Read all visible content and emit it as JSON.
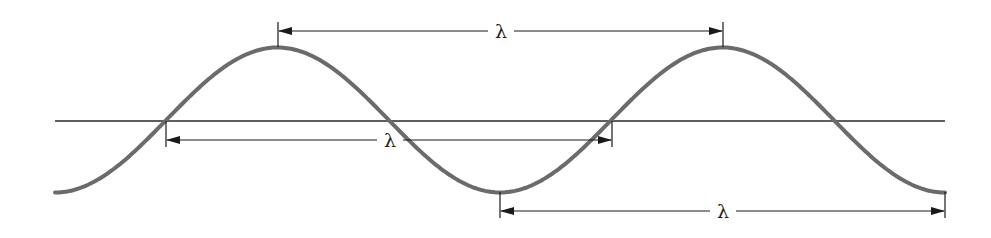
{
  "diagram": {
    "title": "",
    "colors": {
      "wave": "#6b6b6b",
      "axis": "#2a2a2a",
      "dimension_lines": "#1a1a1a",
      "background": "#ffffff"
    },
    "labels": {
      "top": "λ",
      "middle": "λ",
      "bottom": "λ"
    },
    "measurements": [
      {
        "name": "crest-to-crest",
        "label": "λ",
        "from": "first crest",
        "to": "second crest"
      },
      {
        "name": "zero-crossing-to-zero-crossing",
        "label": "λ",
        "from": "first upward crossing",
        "to": "second upward crossing"
      },
      {
        "name": "trough-to-trough",
        "label": "λ",
        "from": "trough",
        "to": "end trough"
      }
    ]
  }
}
